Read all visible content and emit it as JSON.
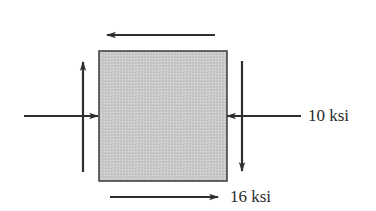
{
  "diagram": {
    "type": "stress-element",
    "element": {
      "shape": "square",
      "x": 99,
      "y": 51,
      "width": 128,
      "height": 130,
      "fill": "#c9c9c9",
      "stroke": "#3a3a3a"
    },
    "labels": {
      "normal_stress": "10 ksi",
      "shear_stress": "16 ksi"
    },
    "arrows": [
      {
        "id": "top-shear",
        "direction": "left",
        "x1": 215,
        "y1": 35,
        "x2": 107,
        "y2": 35
      },
      {
        "id": "bottom-shear",
        "direction": "right",
        "x1": 110,
        "y1": 197,
        "x2": 218,
        "y2": 197
      },
      {
        "id": "left-shear",
        "direction": "up",
        "x1": 83,
        "y1": 172,
        "x2": 83,
        "y2": 62
      },
      {
        "id": "right-shear",
        "direction": "down",
        "x1": 242,
        "y1": 61,
        "x2": 242,
        "y2": 171
      },
      {
        "id": "left-normal",
        "direction": "right",
        "x1": 24,
        "y1": 116,
        "x2": 98,
        "y2": 116
      },
      {
        "id": "right-normal",
        "direction": "left",
        "x1": 301,
        "y1": 116,
        "x2": 227,
        "y2": 116
      }
    ],
    "colors": {
      "arrow": "#2e2e2e",
      "text": "#2a2a2a"
    }
  }
}
